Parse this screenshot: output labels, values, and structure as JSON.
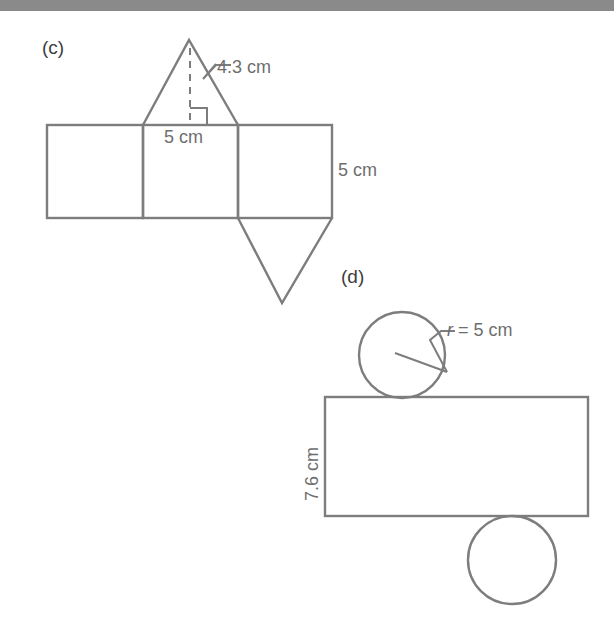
{
  "page": {
    "width": 614,
    "height": 644,
    "background_color": "#ffffff",
    "top_bar_color": "#8a8a8a",
    "stroke_color": "#7d7d7d",
    "label_color": "#6e6e6e",
    "part_label_color": "#3d3d3d"
  },
  "figures": [
    {
      "id": "c",
      "part_label": "(c)",
      "description": "net-of-triangular-prism",
      "labels": [
        {
          "name": "slant-height-label",
          "text": "4.3 cm"
        },
        {
          "name": "base-width-label",
          "text": "5 cm"
        },
        {
          "name": "prism-length-label",
          "text": "5 cm"
        }
      ]
    },
    {
      "id": "d",
      "part_label": "(d)",
      "description": "net-of-cylinder",
      "labels": [
        {
          "name": "radius-label",
          "text_italic": "r",
          "text": " =  5 cm",
          "full_text": "r = 5 cm"
        },
        {
          "name": "cylinder-height-label",
          "text": "7.6 cm"
        }
      ]
    }
  ]
}
